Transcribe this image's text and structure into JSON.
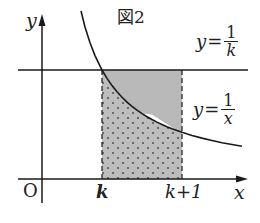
{
  "figure": {
    "title": "図2",
    "axes": {
      "x_label": "x",
      "y_label": "y",
      "origin_label": "O"
    },
    "ticks": {
      "k": "k",
      "k_plus_1": "k+1"
    },
    "curves": {
      "horizontal_line": {
        "var": "y",
        "op": "=",
        "num": "1",
        "den": "k"
      },
      "hyperbola": {
        "var": "y",
        "op": "=",
        "num": "1",
        "den": "x"
      }
    },
    "colors": {
      "stroke": "#1a1a1a",
      "shade_upper": "#b9b9b9",
      "shade_lower": "#bdbdbd",
      "dots": "#555555"
    }
  }
}
